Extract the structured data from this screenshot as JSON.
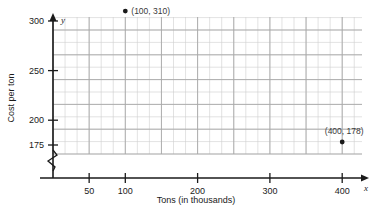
{
  "chart_data": {
    "type": "scatter",
    "title": "",
    "xlabel": "Tons (in thousands)",
    "ylabel": "Cost per ton",
    "x_axis_letter": "x",
    "y_axis_letter": "y",
    "xlim": [
      0,
      435
    ],
    "ylim": [
      165,
      425
    ],
    "x_ticks": [
      50,
      100,
      200,
      300,
      400
    ],
    "x_tick_labels": [
      "50",
      "100",
      "200",
      "300",
      "400"
    ],
    "y_ticks": [
      175,
      200,
      250,
      300,
      350,
      400
    ],
    "y_tick_labels": [
      "175",
      "200",
      "250",
      "300",
      "350",
      "400"
    ],
    "grid": true,
    "grid_minor_step_x": 16.67,
    "grid_minor_step_y": 12.5,
    "y_axis_break": true,
    "legend": "none",
    "points": [
      {
        "x": 50,
        "y": 409,
        "label": "(50, 409)"
      },
      {
        "x": 100,
        "y": 310,
        "label": "(100, 310)"
      },
      {
        "x": 400,
        "y": 178,
        "label": "(400, 178)"
      }
    ]
  },
  "colors": {
    "grid_minor": "#cfcfcf",
    "grid_major": "#a8a8a8",
    "axis": "#1a1a1a",
    "point": "#1a1a1a",
    "label_text": "#3a3a3a",
    "background": "#ffffff"
  }
}
